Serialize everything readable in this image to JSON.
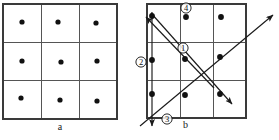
{
  "figure": {
    "caption_a": "a",
    "caption_b": "b",
    "panel_a": {
      "label": "a",
      "grid": {
        "rows": 3,
        "cols": 3,
        "x": 3,
        "y": 4,
        "width": 114,
        "height": 115
      },
      "dots": [
        {
          "x": 22,
          "y": 22
        },
        {
          "x": 58,
          "y": 22
        },
        {
          "x": 96,
          "y": 23
        },
        {
          "x": 22,
          "y": 61
        },
        {
          "x": 61,
          "y": 62
        },
        {
          "x": 97,
          "y": 61
        },
        {
          "x": 21,
          "y": 98
        },
        {
          "x": 60,
          "y": 100
        },
        {
          "x": 97,
          "y": 101
        }
      ],
      "dot_radius": 2.6
    },
    "panel_b": {
      "label": "b",
      "grid": {
        "rows": 3,
        "cols": 3,
        "x": 147,
        "y": 4,
        "width": 99,
        "height": 114
      },
      "dots": [
        {
          "x": 152,
          "y": 16
        },
        {
          "x": 186,
          "y": 17
        },
        {
          "x": 221,
          "y": 17
        },
        {
          "x": 152,
          "y": 60
        },
        {
          "x": 185,
          "y": 59
        },
        {
          "x": 220,
          "y": 57
        },
        {
          "x": 152,
          "y": 94
        },
        {
          "x": 185,
          "y": 95
        },
        {
          "x": 220,
          "y": 94
        }
      ],
      "dot_radius": 2.9,
      "arrows": [
        {
          "name": "arrow-1-diagonal-up-left",
          "x1": 214,
          "y1": 88,
          "x2": 146,
          "y2": 17
        },
        {
          "name": "arrow-2-vertical-down",
          "x1": 152,
          "y1": 12,
          "x2": 152,
          "y2": 126
        },
        {
          "name": "arrow-3-diagonal-up-right",
          "x1": 140,
          "y1": 126,
          "x2": 273,
          "y2": 15
        },
        {
          "name": "arrow-4-diagonal-down-right",
          "x1": 151,
          "y1": 13,
          "x2": 232,
          "y2": 104
        }
      ],
      "markers": [
        {
          "id": "1",
          "symbol": "①",
          "x": 183,
          "y": 48
        },
        {
          "id": "2",
          "symbol": "②",
          "x": 141,
          "y": 62
        },
        {
          "id": "3",
          "symbol": "③",
          "x": 167,
          "y": 119
        },
        {
          "id": "4",
          "symbol": "④",
          "x": 186,
          "y": 8
        }
      ]
    },
    "colors": {
      "grid_line": "#555555",
      "grid_frame": "#3a3a3a",
      "dot": "#111111",
      "arrow": "#1a1a1a",
      "background": "#ffffff"
    }
  }
}
